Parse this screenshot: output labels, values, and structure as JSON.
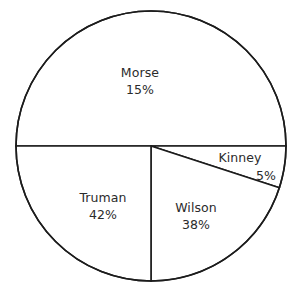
{
  "chart_data": {
    "type": "pie",
    "title": "",
    "subtitle": "",
    "xlabel": "",
    "ylabel": "",
    "legend_position": "none",
    "grid": false,
    "value_unit": "%",
    "categories": [
      "Morse",
      "Kinney",
      "Wilson",
      "Truman"
    ],
    "values": [
      15,
      5,
      38,
      42
    ],
    "slices": [
      {
        "name": "Morse",
        "value": 15,
        "value_label": "15%",
        "drawn_start_angle_deg": 180,
        "drawn_end_angle_deg": 360,
        "drawn_sweep_deg": 180,
        "label_x": 140,
        "label_y": 72,
        "value_x": 140,
        "value_y": 89
      },
      {
        "name": "Kinney",
        "value": 5,
        "value_label": "5%",
        "drawn_start_angle_deg": 0,
        "drawn_end_angle_deg": 18,
        "drawn_sweep_deg": 18,
        "label_x": 240,
        "label_y": 157,
        "value_x": 266,
        "value_y": 175
      },
      {
        "name": "Wilson",
        "value": 38,
        "value_label": "38%",
        "drawn_start_angle_deg": 18,
        "drawn_end_angle_deg": 90,
        "drawn_sweep_deg": 72,
        "label_x": 196,
        "label_y": 207,
        "value_x": 196,
        "value_y": 224
      },
      {
        "name": "Truman",
        "value": 42,
        "value_label": "42%",
        "drawn_start_angle_deg": 90,
        "drawn_end_angle_deg": 180,
        "drawn_sweep_deg": 90,
        "label_x": 103,
        "label_y": 197,
        "value_x": 103,
        "value_y": 214
      }
    ],
    "geometry": {
      "center_x": 151,
      "center_y": 146,
      "radius": 135
    },
    "colors": {
      "slice_fill": "#ffffff",
      "stroke": "#1c1c1c",
      "text": "#2b2b2b",
      "background": "#ffffff"
    }
  }
}
